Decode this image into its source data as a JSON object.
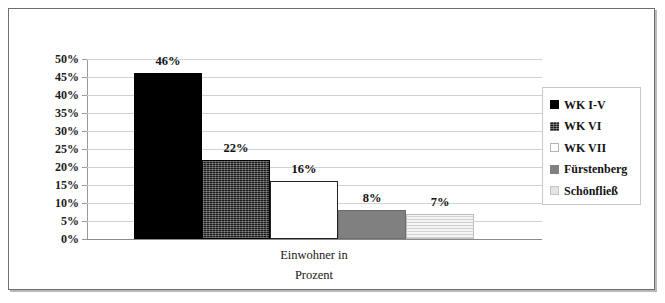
{
  "chart_data": {
    "type": "bar",
    "title": "",
    "xlabel": "Einwohner in Prozent",
    "ylabel": "",
    "categories": [
      "WK I-V",
      "WK VI",
      "WK VII",
      "Fürstenberg",
      "Schönfließ"
    ],
    "values": [
      46,
      22,
      16,
      8,
      7
    ],
    "data_labels": [
      "46%",
      "22%",
      "16%",
      "8%",
      "7%"
    ],
    "ylim": [
      0,
      50
    ],
    "ytick_labels": [
      "50%",
      "45%",
      "40%",
      "35%",
      "30%",
      "25%",
      "20%",
      "15%",
      "10%",
      "5%",
      "0%"
    ],
    "ytick_values": [
      50,
      45,
      40,
      35,
      30,
      25,
      20,
      15,
      10,
      5,
      0
    ],
    "grid": true,
    "legend_position": "right",
    "series": [
      {
        "name": "WK I-V",
        "value": 46,
        "label": "46%",
        "fill": "solid-black",
        "color": "#000000"
      },
      {
        "name": "WK VI",
        "value": 22,
        "label": "22%",
        "fill": "crosshatch-dark",
        "color": "#1b1b1b"
      },
      {
        "name": "WK VII",
        "value": 16,
        "label": "16%",
        "fill": "white-outline",
        "color": "#ffffff"
      },
      {
        "name": "Fürstenberg",
        "value": 8,
        "label": "8%",
        "fill": "mid-gray",
        "color": "#808080"
      },
      {
        "name": "Schönfließ",
        "value": 7,
        "label": "7%",
        "fill": "light-lines",
        "color": "#e9e9e9"
      }
    ]
  },
  "axis_title": {
    "line1": "Einwohner in",
    "line2": "Prozent"
  },
  "legend": {
    "items": [
      {
        "label": "WK I-V"
      },
      {
        "label": "WK VI"
      },
      {
        "label": "WK VII"
      },
      {
        "label": "Fürstenberg"
      },
      {
        "label": "Schönfließ"
      }
    ]
  }
}
